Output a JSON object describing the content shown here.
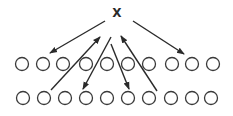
{
  "diagram": {
    "label": "X",
    "label_pos": {
      "x": 117,
      "y": 17
    },
    "circle_radius": 6.5,
    "rows": [
      {
        "name": "top-row",
        "y": 64,
        "xs": [
          22,
          43,
          63,
          86,
          107,
          128,
          149,
          172,
          192,
          213
        ]
      },
      {
        "name": "bottom-row",
        "y": 98,
        "xs": [
          23,
          44,
          65,
          86,
          107,
          128,
          149,
          171,
          192,
          211
        ]
      }
    ],
    "arrows": [
      {
        "from": [
          105,
          21
        ],
        "to": [
          50,
          53
        ]
      },
      {
        "from": [
          133,
          21
        ],
        "to": [
          184,
          54
        ]
      },
      {
        "from": [
          51,
          90
        ],
        "to": [
          100,
          37
        ]
      },
      {
        "from": [
          111,
          37
        ],
        "to": [
          83,
          89
        ]
      },
      {
        "from": [
          111,
          44
        ],
        "to": [
          129,
          89
        ]
      },
      {
        "from": [
          157,
          91
        ],
        "to": [
          121,
          36
        ]
      }
    ],
    "colors": {
      "stroke": "#2a2a2a",
      "circle_stroke": "#3a3a3a",
      "background": "#ffffff"
    }
  }
}
